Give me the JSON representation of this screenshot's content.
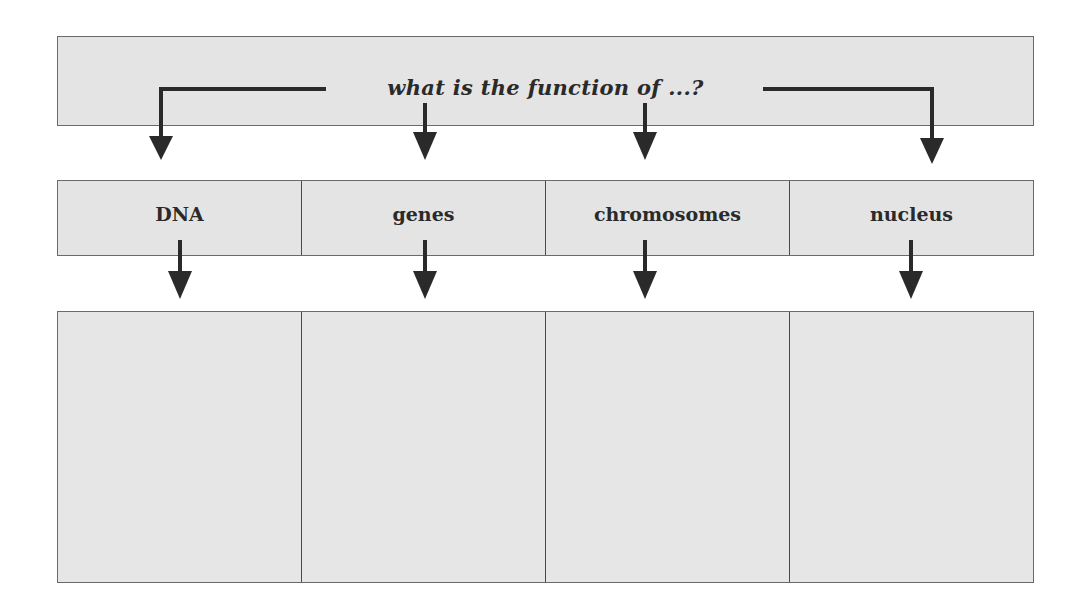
{
  "diagram": {
    "question": "what is the function of ...?",
    "topics": [
      {
        "label": "DNA",
        "answer": ""
      },
      {
        "label": "genes",
        "answer": ""
      },
      {
        "label": "chromosomes",
        "answer": ""
      },
      {
        "label": "nucleus",
        "answer": ""
      }
    ],
    "colors": {
      "box_fill": "#e4e4e4",
      "border": "#6a6a6a",
      "arrow": "#2a2a2a",
      "text": "#2a2a2a"
    }
  }
}
